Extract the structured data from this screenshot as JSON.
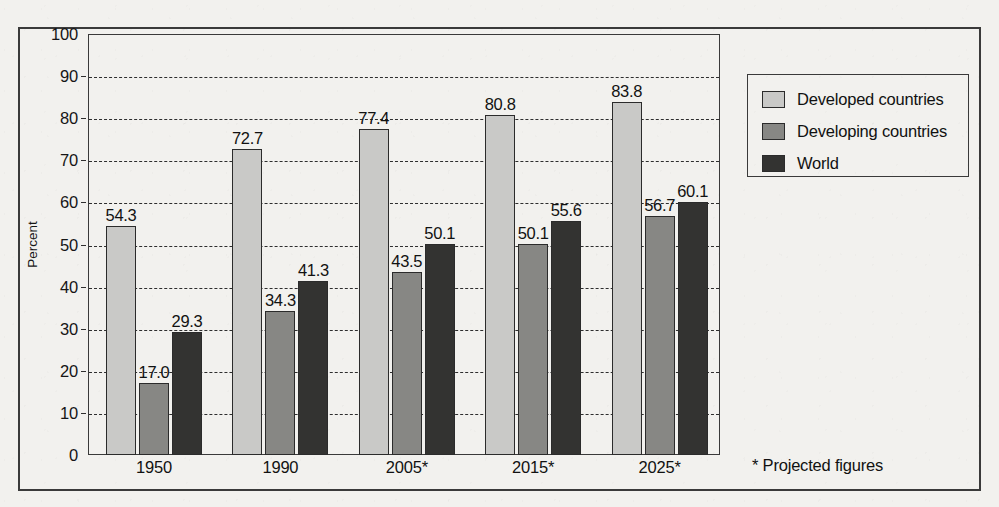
{
  "chart_data": {
    "type": "bar",
    "title": "",
    "xlabel": "",
    "ylabel": "Percent",
    "ylim": [
      0,
      100
    ],
    "yticks": [
      0,
      10,
      20,
      30,
      40,
      50,
      60,
      70,
      80,
      90,
      100
    ],
    "grid": true,
    "legend_position": "right",
    "categories": [
      "1950",
      "1990",
      "2005*",
      "2015*",
      "2025*"
    ],
    "series": [
      {
        "name": "Developed countries",
        "color": "#c9c9c7",
        "values": [
          54.3,
          72.7,
          77.4,
          80.8,
          83.8
        ],
        "labels": [
          "54.3",
          "72.7",
          "77.4",
          "80.8",
          "83.8"
        ]
      },
      {
        "name": "Developing countries",
        "color": "#878784",
        "values": [
          17.0,
          34.3,
          43.5,
          50.1,
          56.7
        ],
        "labels": [
          "17.0",
          "34.3",
          "43.5",
          "50.1",
          "56.7"
        ]
      },
      {
        "name": "World",
        "color": "#333331",
        "values": [
          29.3,
          41.3,
          50.1,
          55.6,
          60.1
        ],
        "labels": [
          "29.3",
          "41.3",
          "50.1",
          "55.6",
          "60.1"
        ]
      }
    ],
    "annotations": [
      "* Projected figures"
    ]
  },
  "axis": {
    "y_title": "Percent",
    "y_tick_labels": [
      "100",
      "90",
      "80",
      "70",
      "60",
      "50",
      "40",
      "30",
      "20",
      "10",
      "0"
    ],
    "x_tick_labels": [
      "1950",
      "1990",
      "2005*",
      "2015*",
      "2025*"
    ]
  },
  "legend": {
    "items": [
      {
        "label": "Developed countries",
        "swatch": "legend-swatch-developed"
      },
      {
        "label": "Developing countries",
        "swatch": "legend-swatch-developing"
      },
      {
        "label": "World",
        "swatch": "legend-swatch-world"
      }
    ]
  },
  "footnote": {
    "text": "* Projected figures"
  }
}
